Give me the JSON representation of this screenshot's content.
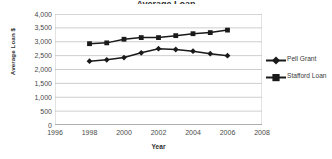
{
  "chart_data": {
    "type": "line",
    "title": "Average Loan",
    "xlabel": "Year",
    "ylabel": "Average Loan $",
    "x": [
      1998,
      1999,
      2000,
      2001,
      2002,
      2003,
      2004,
      2005,
      2006
    ],
    "xlim": [
      1996,
      2008
    ],
    "ylim": [
      0,
      4000
    ],
    "xticks": [
      "1996",
      "1998",
      "2000",
      "2002",
      "2004",
      "2006",
      "2008"
    ],
    "xtick_values": [
      1996,
      1998,
      2000,
      2002,
      2004,
      2006,
      2008
    ],
    "yticks": [
      "0",
      "500",
      "1,000",
      "1,500",
      "2,000",
      "2,500",
      "3,000",
      "3,500",
      "4,000"
    ],
    "ytick_values": [
      0,
      500,
      1000,
      1500,
      2000,
      2500,
      3000,
      3500,
      4000
    ],
    "grid": "horizontal",
    "legend_position": "right",
    "series": [
      {
        "name": "Pell Grant",
        "marker": "diamond",
        "color": "#1a1a1a",
        "values": [
          2300,
          2350,
          2430,
          2600,
          2750,
          2720,
          2660,
          2570,
          2500
        ]
      },
      {
        "name": "Stafford Loan",
        "marker": "square",
        "color": "#1a1a1a",
        "values": [
          2930,
          2960,
          3090,
          3150,
          3150,
          3220,
          3290,
          3330,
          3420
        ]
      }
    ]
  },
  "legend": {
    "items": [
      {
        "label": "Pell Grant",
        "marker": "diamond"
      },
      {
        "label": "Stafford Loan",
        "marker": "square"
      }
    ]
  },
  "axes": {
    "y_title": "Average Loan $",
    "x_title": "Year"
  }
}
